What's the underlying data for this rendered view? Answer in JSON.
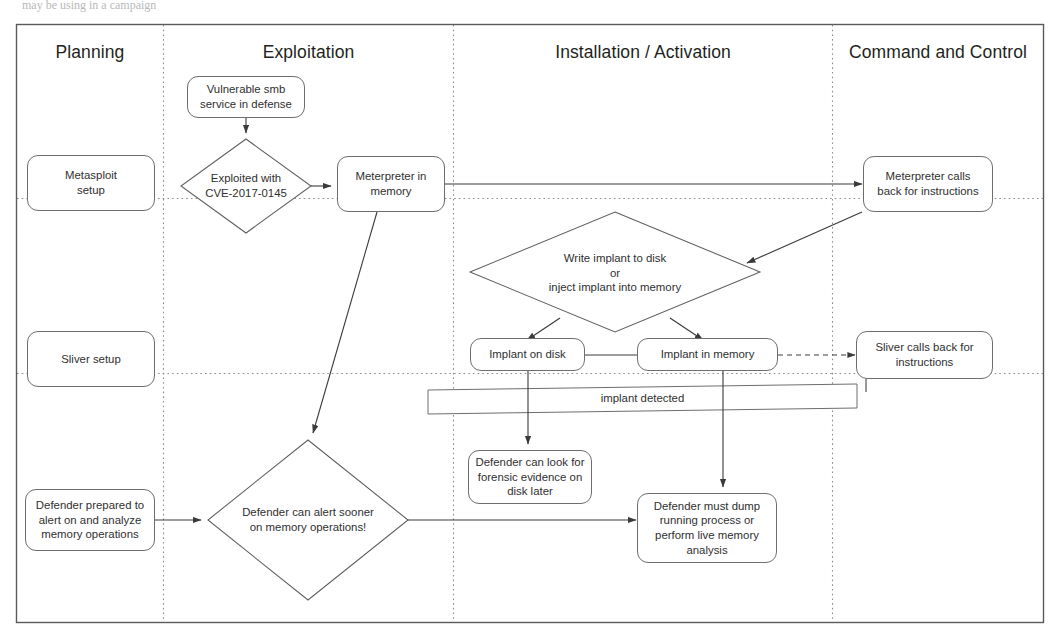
{
  "page": {
    "partial_top_text": "may be using in a campaign"
  },
  "frame": {
    "border_color": "#5a5a5a",
    "divider_color": "#9a9a9a"
  },
  "lanes": [
    {
      "id": "planning",
      "title": "Planning"
    },
    {
      "id": "exploitation",
      "title": "Exploitation"
    },
    {
      "id": "installation",
      "title": "Installation / Activation"
    },
    {
      "id": "c2",
      "title": "Command and Control"
    }
  ],
  "nodes": [
    {
      "id": "metasploit-setup",
      "shape": "rounded-rect",
      "label": "Metasploit\nsetup"
    },
    {
      "id": "sliver-setup",
      "shape": "rounded-rect",
      "label": "Sliver setup"
    },
    {
      "id": "defender-prepared",
      "shape": "rounded-rect",
      "label": "Defender prepared to\nalert on and analyze\nmemory operations"
    },
    {
      "id": "vulnerable-smb",
      "shape": "rounded-rect",
      "label": "Vulnerable smb\nservice in defense"
    },
    {
      "id": "exploited-cve",
      "shape": "diamond",
      "label": "Exploited with\nCVE-2017-0145"
    },
    {
      "id": "meterpreter-in-memory",
      "shape": "rounded-rect",
      "label": "Meterpreter in\nmemory"
    },
    {
      "id": "defender-alert-sooner",
      "shape": "diamond",
      "label": "Defender can alert sooner\non memory operations!"
    },
    {
      "id": "write-or-inject",
      "shape": "diamond",
      "label": "Write implant to disk\nor\ninject implant into memory"
    },
    {
      "id": "implant-on-disk",
      "shape": "rounded-rect",
      "label": "Implant on disk"
    },
    {
      "id": "implant-in-memory",
      "shape": "rounded-rect",
      "label": "Implant in memory"
    },
    {
      "id": "implant-detected-band",
      "shape": "band",
      "label": "implant detected"
    },
    {
      "id": "forensic-evidence",
      "shape": "rounded-rect",
      "label": "Defender can look for\nforensic evidence on\ndisk later"
    },
    {
      "id": "defender-must-dump",
      "shape": "rounded-rect",
      "label": "Defender must dump\nrunning process or\nperform live memory\nanalysis"
    },
    {
      "id": "meterpreter-calls-back",
      "shape": "rounded-rect",
      "label": "Meterpreter calls\nback for instructions"
    },
    {
      "id": "sliver-calls-back",
      "shape": "rounded-rect",
      "label": "Sliver calls back for\ninstructions"
    }
  ],
  "node_text": {
    "metasploit_setup_l1": "Metasploit",
    "metasploit_setup_l2": "setup",
    "sliver_setup": "Sliver setup",
    "defender_prepared_l1": "Defender prepared to",
    "defender_prepared_l2": "alert on and analyze",
    "defender_prepared_l3": "memory operations",
    "vulnerable_smb_l1": "Vulnerable smb",
    "vulnerable_smb_l2": "service in defense",
    "exploited_cve_l1": "Exploited with",
    "exploited_cve_l2": "CVE-2017-0145",
    "meterpreter_mem_l1": "Meterpreter in",
    "meterpreter_mem_l2": "memory",
    "alert_sooner_l1": "Defender can alert sooner",
    "alert_sooner_l2": "on memory operations!",
    "write_inject_l1": "Write implant to disk",
    "write_inject_l2": "or",
    "write_inject_l3": "inject implant into memory",
    "implant_on_disk": "Implant on disk",
    "implant_in_memory": "Implant in memory",
    "implant_detected": "implant detected",
    "forensic_l1": "Defender can look for",
    "forensic_l2": "forensic evidence on",
    "forensic_l3": "disk later",
    "must_dump_l1": "Defender must dump",
    "must_dump_l2": "running process or",
    "must_dump_l3": "perform live memory",
    "must_dump_l4": "analysis",
    "meterpreter_calls_l1": "Meterpreter calls",
    "meterpreter_calls_l2": "back for instructions",
    "sliver_calls_l1": "Sliver calls back for",
    "sliver_calls_l2": "instructions"
  },
  "edges": [
    {
      "from": "vulnerable-smb",
      "to": "exploited-cve",
      "style": "solid-arrow"
    },
    {
      "from": "exploited-cve",
      "to": "meterpreter-in-memory",
      "style": "solid-arrow"
    },
    {
      "from": "meterpreter-in-memory",
      "to": "meterpreter-calls-back",
      "style": "solid-arrow"
    },
    {
      "from": "meterpreter-in-memory",
      "to": "defender-alert-sooner",
      "style": "solid-arrow"
    },
    {
      "from": "meterpreter-calls-back",
      "to": "write-or-inject",
      "style": "solid-arrow"
    },
    {
      "from": "write-or-inject",
      "to": "implant-on-disk",
      "style": "solid-arrow"
    },
    {
      "from": "write-or-inject",
      "to": "implant-in-memory",
      "style": "solid-arrow"
    },
    {
      "from": "implant-on-disk",
      "to": "implant-in-memory",
      "style": "solid-line"
    },
    {
      "from": "implant-in-memory",
      "to": "sliver-calls-back",
      "style": "dashed-arrow"
    },
    {
      "from": "sliver-calls-back",
      "to": "implant-detected-band",
      "style": "solid-line"
    },
    {
      "from": "implant-on-disk",
      "to": "forensic-evidence",
      "style": "solid-arrow"
    },
    {
      "from": "implant-in-memory",
      "to": "defender-must-dump",
      "style": "solid-arrow"
    },
    {
      "from": "defender-prepared",
      "to": "defender-alert-sooner",
      "style": "solid-arrow"
    },
    {
      "from": "defender-alert-sooner",
      "to": "defender-must-dump",
      "style": "solid-arrow"
    },
    {
      "from": "metasploit-setup",
      "to": "exploited-cve",
      "style": "dotted-lane"
    },
    {
      "from": "sliver-setup",
      "to": "sliver-calls-back",
      "style": "dotted-lane"
    }
  ]
}
